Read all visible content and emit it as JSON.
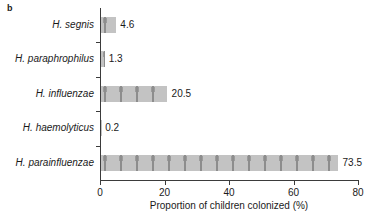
{
  "panel": {
    "label": "b"
  },
  "chart_data": {
    "type": "bar",
    "orientation": "horizontal",
    "title": "",
    "subtitle": "",
    "xlabel": "Proportion of children colonized (%)",
    "ylabel": "",
    "categories": [
      "H. segnis",
      "H. paraphrophilus",
      "H. influenzae",
      "H. haemolyticus",
      "H. parainfluenzae"
    ],
    "values": [
      4.6,
      1.3,
      20.5,
      0.2,
      73.5
    ],
    "value_labels": [
      "4.6",
      "1.3",
      "20.5",
      "0.2",
      "73.5"
    ],
    "xlim": [
      0,
      80
    ],
    "xticks": [
      0,
      20,
      40,
      60,
      80
    ],
    "xtick_labels": [
      "0",
      "20",
      "40",
      "60",
      "80"
    ],
    "grid": false,
    "legend": null,
    "bar_fill_color": "#c3c3c3",
    "bar_pattern_color": "#8d8d8d",
    "axis_color": "#3b3b3b"
  }
}
